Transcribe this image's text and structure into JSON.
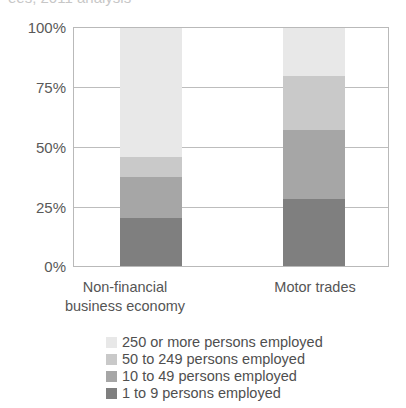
{
  "chart_title": "ees, 2011 analysis",
  "axis": {
    "y_ticks": [
      "100%",
      "75%",
      "50%",
      "25%",
      "0%"
    ],
    "y_tick_values": [
      100,
      75,
      50,
      25,
      0
    ]
  },
  "chart_data": {
    "type": "bar",
    "subtype": "stacked-percentage",
    "title": "ees, 2011 analysis",
    "xlabel": "",
    "ylabel": "",
    "ylim": [
      0,
      100
    ],
    "grid": true,
    "legend_position": "bottom",
    "categories": [
      "Non-financial business economy",
      "Motor trades"
    ],
    "series": [
      {
        "name": "1 to 9 persons employed",
        "color": "#7f7f7f",
        "values": [
          20,
          28
        ]
      },
      {
        "name": "10 to 49 persons employed",
        "color": "#a6a6a6",
        "values": [
          17.5,
          29
        ]
      },
      {
        "name": "50 to 249 persons employed",
        "color": "#c9c9c9",
        "values": [
          8.5,
          23
        ]
      },
      {
        "name": "250 or more persons employed",
        "color": "#e8e8e8",
        "values": [
          54,
          20
        ]
      }
    ],
    "cumulative_tops": {
      "Non-financial business economy": [
        20,
        37.5,
        46,
        100
      ],
      "Motor trades": [
        28,
        57,
        80,
        100
      ]
    }
  },
  "x_categories": [
    {
      "line1": "Non-financial",
      "line2": "business economy"
    },
    {
      "line1": "Motor trades",
      "line2": ""
    }
  ],
  "legend": {
    "items": [
      {
        "label": "250 or more persons employed",
        "color": "#e8e8e8"
      },
      {
        "label": "50 to 249 persons employed",
        "color": "#c9c9c9"
      },
      {
        "label": "10 to 49 persons employed",
        "color": "#a6a6a6"
      },
      {
        "label": "1 to 9 persons employed",
        "color": "#7f7f7f"
      }
    ]
  }
}
